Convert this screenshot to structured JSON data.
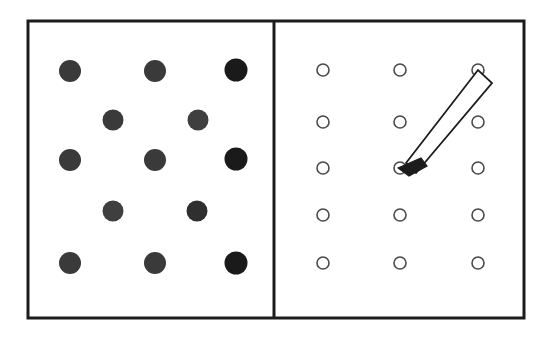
{
  "figure": {
    "canvas": {
      "width": 553,
      "height": 337,
      "background": "#ffffff"
    },
    "frame": {
      "x": 28,
      "y": 21,
      "width": 496,
      "height": 297,
      "stroke_color": "#1c1c1c",
      "stroke_width": 3
    },
    "divider": {
      "x": 274,
      "y_top": 21,
      "y_bottom": 318,
      "stroke_color": "#1c1c1c",
      "stroke_width": 3
    },
    "left_panel": {
      "label": "left-panel",
      "marker_style": "filled-dot",
      "marker_fill_default": "#3a3a3a",
      "marker_fill_dark": "#1a1a1a",
      "marker_radius": 11,
      "pattern": "quincunx",
      "row_counts": [
        3,
        2,
        3,
        2,
        3
      ],
      "dots": [
        {
          "id": "L-r1c1",
          "cx": 70,
          "cy": 71,
          "r": 11,
          "fill": "#3a3a3a"
        },
        {
          "id": "L-r1c2",
          "cx": 155,
          "cy": 71,
          "r": 11,
          "fill": "#3a3a3a"
        },
        {
          "id": "L-r1c3",
          "cx": 236,
          "cy": 70,
          "r": 11.5,
          "fill": "#1a1a1a"
        },
        {
          "id": "L-r2c1",
          "cx": 113,
          "cy": 120,
          "r": 10.5,
          "fill": "#3a3a3a"
        },
        {
          "id": "L-r2c2",
          "cx": 198,
          "cy": 120,
          "r": 10.5,
          "fill": "#3f3f3f"
        },
        {
          "id": "L-r3c1",
          "cx": 70,
          "cy": 160,
          "r": 11,
          "fill": "#3a3a3a"
        },
        {
          "id": "L-r3c2",
          "cx": 155,
          "cy": 160,
          "r": 11,
          "fill": "#3a3a3a"
        },
        {
          "id": "L-r3c3",
          "cx": 236,
          "cy": 159,
          "r": 11.5,
          "fill": "#1a1a1a"
        },
        {
          "id": "L-r4c1",
          "cx": 113,
          "cy": 211,
          "r": 10.5,
          "fill": "#3f3f3f"
        },
        {
          "id": "L-r4c2",
          "cx": 197,
          "cy": 211,
          "r": 10.5,
          "fill": "#2f2f2f"
        },
        {
          "id": "L-r5c1",
          "cx": 70,
          "cy": 263,
          "r": 11,
          "fill": "#3a3a3a"
        },
        {
          "id": "L-r5c2",
          "cx": 155,
          "cy": 263,
          "r": 11,
          "fill": "#3a3a3a"
        },
        {
          "id": "L-r5c3",
          "cx": 236,
          "cy": 263,
          "r": 11.5,
          "fill": "#1a1a1a"
        }
      ]
    },
    "right_panel": {
      "label": "right-panel",
      "marker_style": "open-circle",
      "marker_stroke": "#4a4a4a",
      "marker_radius": 6,
      "pattern": "regular-grid",
      "grid_columns": 3,
      "grid_rows": 5,
      "column_x": [
        323,
        400,
        478
      ],
      "row_y": [
        70,
        122,
        168,
        215,
        263
      ],
      "circles": [
        {
          "id": "R-r1c1",
          "cx": 323,
          "cy": 70,
          "r": 6
        },
        {
          "id": "R-r1c2",
          "cx": 400,
          "cy": 70,
          "r": 6
        },
        {
          "id": "R-r1c3",
          "cx": 478,
          "cy": 70,
          "r": 6
        },
        {
          "id": "R-r2c1",
          "cx": 323,
          "cy": 122,
          "r": 6
        },
        {
          "id": "R-r2c2",
          "cx": 400,
          "cy": 122,
          "r": 6
        },
        {
          "id": "R-r2c3",
          "cx": 478,
          "cy": 122,
          "r": 6
        },
        {
          "id": "R-r3c1",
          "cx": 323,
          "cy": 168,
          "r": 6
        },
        {
          "id": "R-r3c2",
          "cx": 400,
          "cy": 168,
          "r": 6
        },
        {
          "id": "R-r3c3",
          "cx": 478,
          "cy": 168,
          "r": 6
        },
        {
          "id": "R-r4c1",
          "cx": 323,
          "cy": 215,
          "r": 6
        },
        {
          "id": "R-r4c2",
          "cx": 400,
          "cy": 215,
          "r": 6
        },
        {
          "id": "R-r4c3",
          "cx": 478,
          "cy": 215,
          "r": 6
        },
        {
          "id": "R-r5c1",
          "cx": 323,
          "cy": 263,
          "r": 6
        },
        {
          "id": "R-r5c2",
          "cx": 400,
          "cy": 263,
          "r": 6
        },
        {
          "id": "R-r5c3",
          "cx": 478,
          "cy": 263,
          "r": 6
        }
      ],
      "pencil": {
        "label": "pencil-pointer",
        "points_at_circle": "R-r3c2",
        "tip_x": 398,
        "tip_y": 168,
        "tail_x": 487,
        "tail_y": 78,
        "body_outline": "406,163 478,70 492,83 416,173",
        "tip_outline": "398,168 421,158 427,166 409,176",
        "body_fill": "#ffffff",
        "body_stroke": "#1c1c1c",
        "tip_fill": "#1c1c1c"
      }
    }
  }
}
